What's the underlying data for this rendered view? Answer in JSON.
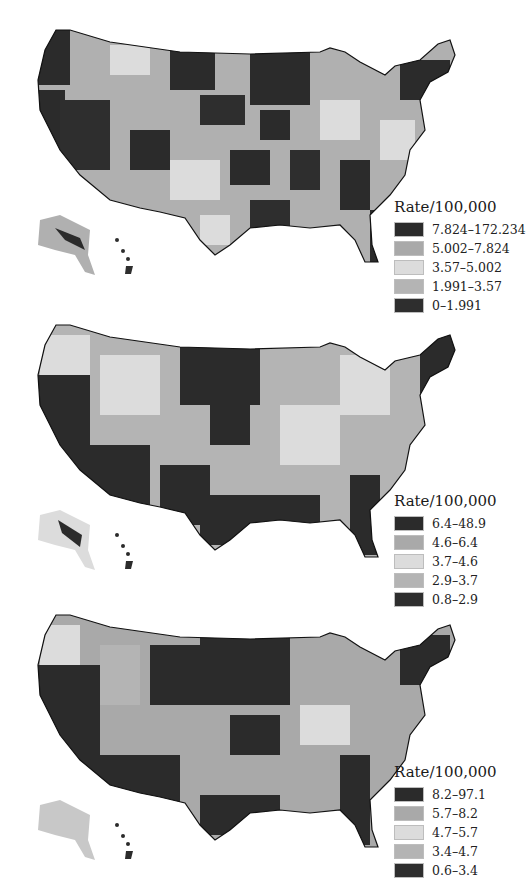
{
  "figure": {
    "maps": [
      {
        "id": "map-a",
        "legend": {
          "title": "Rate/100,000",
          "classes": [
            {
              "label": "7.824–172.234",
              "color": "#2b2b2b"
            },
            {
              "label": "5.002–7.824",
              "color": "#a9a9a9"
            },
            {
              "label": "3.57–5.002",
              "color": "#dcdcdc"
            },
            {
              "label": "1.991–3.57",
              "color": "#b4b4b4"
            },
            {
              "label": "0–1.991",
              "color": "#2e2e2e"
            }
          ]
        }
      },
      {
        "id": "map-b",
        "legend": {
          "title": "Rate/100,000",
          "classes": [
            {
              "label": "6.4–48.9",
              "color": "#2b2b2b"
            },
            {
              "label": "4.6–6.4",
              "color": "#a9a9a9"
            },
            {
              "label": "3.7–4.6",
              "color": "#dcdcdc"
            },
            {
              "label": "2.9–3.7",
              "color": "#b4b4b4"
            },
            {
              "label": "0.8–2.9",
              "color": "#2e2e2e"
            }
          ]
        }
      },
      {
        "id": "map-c",
        "legend": {
          "title": "Rate/100,000",
          "classes": [
            {
              "label": "8.2–97.1",
              "color": "#2b2b2b"
            },
            {
              "label": "5.7–8.2",
              "color": "#a9a9a9"
            },
            {
              "label": "4.7–5.7",
              "color": "#dcdcdc"
            },
            {
              "label": "3.4–4.7",
              "color": "#b4b4b4"
            },
            {
              "label": "0.6–3.4",
              "color": "#2e2e2e"
            }
          ]
        }
      }
    ]
  }
}
